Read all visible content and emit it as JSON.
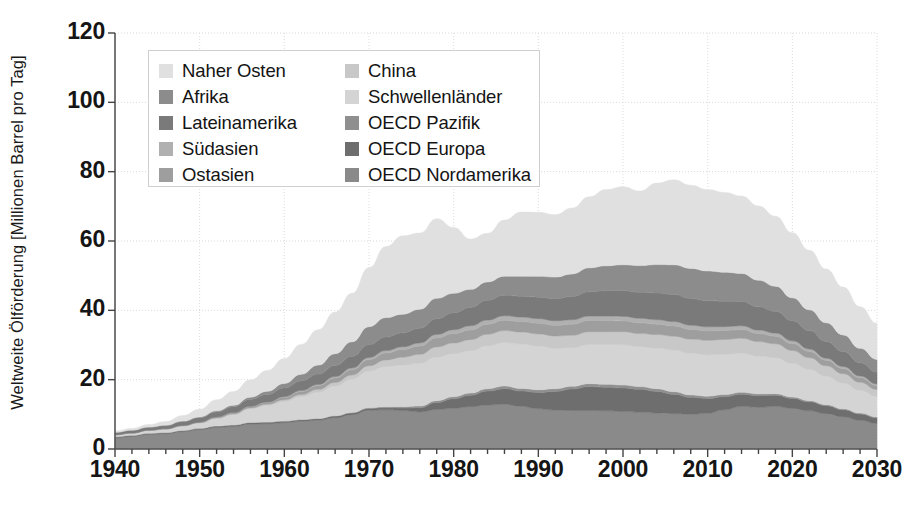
{
  "chart_data": {
    "type": "area",
    "stacked": true,
    "title": "",
    "xlabel": "",
    "ylabel": "Weltweite Ölförderung [Millionen Barrel pro Tag]",
    "xlim": [
      1940,
      2030
    ],
    "ylim": [
      0,
      120
    ],
    "ytick_labels": [
      "0",
      "20",
      "40",
      "60",
      "80",
      "100",
      "120"
    ],
    "yticks": [
      0,
      20,
      40,
      60,
      80,
      100,
      120
    ],
    "xtick_labels": [
      "1940",
      "1950",
      "1960",
      "1970",
      "1980",
      "1990",
      "2000",
      "2010",
      "2020",
      "2030"
    ],
    "xticks": [
      1940,
      1950,
      1960,
      1970,
      1980,
      1990,
      2000,
      2010,
      2020,
      2030
    ],
    "minor_xtick_interval": 2,
    "grid": true,
    "legend_position": "upper-left-inside",
    "x": [
      1940,
      1942,
      1944,
      1946,
      1948,
      1950,
      1952,
      1954,
      1956,
      1958,
      1960,
      1962,
      1964,
      1966,
      1968,
      1970,
      1972,
      1974,
      1976,
      1978,
      1980,
      1982,
      1984,
      1986,
      1988,
      1990,
      1992,
      1994,
      1996,
      1998,
      2000,
      2002,
      2004,
      2006,
      2008,
      2010,
      2012,
      2014,
      2016,
      2018,
      2020,
      2022,
      2024,
      2026,
      2028,
      2030
    ],
    "series": [
      {
        "name": "OECD Nordamerika",
        "color": "#8a8a8a",
        "values": [
          3.2,
          3.6,
          4.2,
          4.4,
          5.0,
          5.6,
          6.2,
          6.5,
          7.2,
          7.3,
          7.6,
          8.0,
          8.3,
          9.0,
          9.9,
          11.2,
          11.3,
          11.1,
          10.7,
          11.4,
          11.8,
          12.2,
          12.7,
          12.9,
          12.3,
          11.6,
          11.2,
          11.1,
          11.1,
          11.0,
          10.8,
          10.6,
          10.4,
          10.2,
          10.0,
          10.3,
          11.3,
          12.3,
          12.0,
          12.3,
          11.7,
          11.0,
          10.2,
          9.3,
          8.3,
          7.4
        ]
      },
      {
        "name": "OECD Europa",
        "color": "#6e6e6e",
        "values": [
          0.3,
          0.3,
          0.3,
          0.3,
          0.3,
          0.3,
          0.4,
          0.4,
          0.4,
          0.4,
          0.4,
          0.4,
          0.4,
          0.5,
          0.5,
          0.5,
          0.6,
          0.7,
          1.2,
          2.0,
          2.7,
          3.3,
          4.0,
          4.5,
          4.4,
          4.7,
          5.4,
          6.2,
          6.9,
          6.8,
          6.8,
          6.6,
          6.2,
          5.6,
          4.9,
          4.3,
          3.8,
          3.5,
          3.4,
          3.2,
          2.9,
          2.6,
          2.3,
          2.0,
          1.8,
          1.6
        ]
      },
      {
        "name": "OECD Pazifik",
        "color": "#8f8f8f",
        "values": [
          0.05,
          0.05,
          0.05,
          0.05,
          0.05,
          0.05,
          0.05,
          0.05,
          0.05,
          0.1,
          0.1,
          0.1,
          0.1,
          0.1,
          0.15,
          0.2,
          0.3,
          0.4,
          0.5,
          0.55,
          0.6,
          0.65,
          0.7,
          0.75,
          0.75,
          0.8,
          0.8,
          0.8,
          0.85,
          0.85,
          0.85,
          0.8,
          0.8,
          0.75,
          0.7,
          0.65,
          0.6,
          0.55,
          0.5,
          0.45,
          0.4,
          0.35,
          0.3,
          0.3,
          0.25,
          0.25
        ]
      },
      {
        "name": "Schwellenländer",
        "color": "#d4d4d4",
        "values": [
          0.5,
          0.6,
          0.8,
          1.0,
          1.3,
          1.6,
          2.2,
          3.0,
          4.0,
          4.8,
          5.6,
          6.6,
          7.6,
          8.6,
          9.6,
          10.6,
          11.6,
          12.0,
          12.3,
          12.6,
          12.4,
          12.2,
          12.4,
          12.6,
          12.8,
          12.6,
          11.6,
          11.1,
          11.3,
          11.5,
          11.6,
          11.5,
          11.7,
          12.0,
          12.0,
          11.9,
          11.6,
          11.3,
          10.9,
          10.4,
          9.7,
          9.0,
          8.2,
          7.4,
          6.6,
          5.9
        ]
      },
      {
        "name": "China",
        "color": "#c8c8c8",
        "values": [
          0.02,
          0.02,
          0.02,
          0.02,
          0.03,
          0.05,
          0.1,
          0.15,
          0.2,
          0.3,
          0.5,
          0.6,
          0.8,
          1.0,
          1.2,
          1.5,
          1.9,
          2.3,
          2.6,
          2.9,
          3.1,
          3.2,
          3.3,
          3.4,
          3.5,
          3.5,
          3.6,
          3.6,
          3.7,
          3.7,
          3.8,
          3.8,
          3.9,
          4.0,
          4.1,
          4.2,
          4.3,
          4.3,
          4.2,
          4.0,
          3.7,
          3.4,
          3.0,
          2.7,
          2.3,
          2.0
        ]
      },
      {
        "name": "Ostasien",
        "color": "#9e9e9e",
        "values": [
          0.05,
          0.05,
          0.05,
          0.05,
          0.1,
          0.1,
          0.2,
          0.3,
          0.4,
          0.5,
          0.7,
          0.9,
          1.1,
          1.3,
          1.5,
          1.8,
          2.0,
          2.2,
          2.4,
          2.6,
          2.7,
          2.8,
          2.9,
          3.0,
          3.0,
          3.1,
          3.1,
          3.2,
          3.2,
          3.2,
          3.1,
          3.1,
          3.0,
          2.9,
          2.8,
          2.7,
          2.6,
          2.5,
          2.3,
          2.2,
          2.0,
          1.8,
          1.6,
          1.5,
          1.3,
          1.2
        ]
      },
      {
        "name": "Südasien",
        "color": "#b0b0b0",
        "values": [
          0.02,
          0.02,
          0.02,
          0.03,
          0.03,
          0.05,
          0.05,
          0.1,
          0.1,
          0.15,
          0.2,
          0.25,
          0.3,
          0.4,
          0.5,
          0.6,
          0.7,
          0.8,
          0.9,
          1.0,
          1.1,
          1.2,
          1.2,
          1.3,
          1.3,
          1.3,
          1.3,
          1.3,
          1.3,
          1.3,
          1.3,
          1.3,
          1.3,
          1.3,
          1.2,
          1.2,
          1.1,
          1.1,
          1.0,
          0.9,
          0.8,
          0.7,
          0.6,
          0.6,
          0.5,
          0.4
        ]
      },
      {
        "name": "Lateinamerika",
        "color": "#7a7a7a",
        "values": [
          0.6,
          0.7,
          0.8,
          0.9,
          1.1,
          1.3,
          1.5,
          1.7,
          2.0,
          2.2,
          2.5,
          2.8,
          3.0,
          3.2,
          3.4,
          3.7,
          3.9,
          4.0,
          4.2,
          4.5,
          4.9,
          5.3,
          5.7,
          5.9,
          6.0,
          6.2,
          6.4,
          6.7,
          7.0,
          7.3,
          7.4,
          7.5,
          7.7,
          7.8,
          7.7,
          7.5,
          7.3,
          7.0,
          6.7,
          6.3,
          5.8,
          5.3,
          4.8,
          4.3,
          3.8,
          3.4
        ]
      },
      {
        "name": "Afrika",
        "color": "#8c8c8c",
        "values": [
          0.1,
          0.1,
          0.1,
          0.1,
          0.15,
          0.2,
          0.3,
          0.4,
          0.6,
          0.9,
          1.3,
          1.9,
          2.6,
          3.4,
          4.2,
          5.2,
          5.6,
          5.4,
          5.5,
          5.9,
          5.6,
          5.2,
          5.3,
          5.5,
          5.8,
          6.0,
          6.2,
          6.5,
          6.9,
          7.2,
          7.5,
          7.7,
          8.2,
          8.6,
          8.7,
          8.6,
          8.4,
          8.1,
          7.7,
          7.2,
          6.6,
          6.0,
          5.4,
          4.8,
          4.2,
          3.7
        ]
      },
      {
        "name": "Naher Osten",
        "color": "#e0e0e0",
        "values": [
          0.4,
          0.5,
          0.7,
          1.1,
          1.6,
          2.2,
          3.2,
          4.0,
          5.0,
          6.0,
          7.2,
          8.6,
          10.2,
          12.0,
          14.0,
          17.0,
          20.5,
          22.6,
          22.0,
          23.0,
          19.0,
          14.5,
          14.0,
          16.2,
          18.5,
          18.5,
          18.0,
          19.0,
          20.5,
          22.0,
          22.5,
          21.5,
          23.5,
          24.5,
          24.0,
          23.5,
          23.0,
          22.3,
          21.4,
          20.2,
          18.8,
          17.2,
          15.5,
          13.8,
          12.0,
          10.4
        ]
      }
    ],
    "total_peak": {
      "year": 2007,
      "value": 78.5
    },
    "annotations": []
  },
  "axes": {
    "y_title": "Weltweite Ölförderung [Millionen Barrel pro Tag]"
  },
  "legend": {
    "left_column": [
      {
        "label": "Naher Osten",
        "color": "#e0e0e0"
      },
      {
        "label": "Afrika",
        "color": "#8c8c8c"
      },
      {
        "label": "Lateinamerika",
        "color": "#7a7a7a"
      },
      {
        "label": "Südasien",
        "color": "#b0b0b0"
      },
      {
        "label": "Ostasien",
        "color": "#9e9e9e"
      }
    ],
    "right_column": [
      {
        "label": "China",
        "color": "#c8c8c8"
      },
      {
        "label": "Schwellenländer",
        "color": "#d4d4d4"
      },
      {
        "label": "OECD Pazifik",
        "color": "#8f8f8f"
      },
      {
        "label": "OECD Europa",
        "color": "#6e6e6e"
      },
      {
        "label": "OECD Nordamerika",
        "color": "#8a8a8a"
      }
    ]
  }
}
